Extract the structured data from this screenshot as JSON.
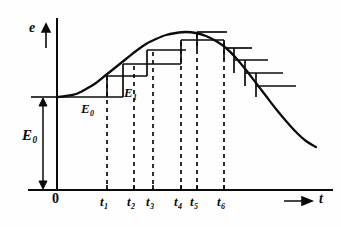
{
  "figure": {
    "background_color": "#fefefe",
    "ink_color": "#0b0b0b"
  },
  "axes": {
    "y_axis_label": "e",
    "x_axis_label": "t",
    "origin_label": "0",
    "y_axis_x_px": 57,
    "y_axis_top_px": 18,
    "x_axis_y_px": 190,
    "x_axis_left_px": 28,
    "x_axis_right_px": 333
  },
  "annotations": {
    "e0_bracket_label": "E",
    "e0_bracket_sub": "0",
    "e0_step_label": "E",
    "e0_step_sub": "0",
    "e1_step_label": "E",
    "e1_step_sub": "1"
  },
  "ticks": [
    {
      "label": "t",
      "sub": "1",
      "x_px": 107
    },
    {
      "label": "t",
      "sub": "2",
      "x_px": 134
    },
    {
      "label": "t",
      "sub": "3",
      "x_px": 153
    },
    {
      "label": "t",
      "sub": "4",
      "x_px": 181
    },
    {
      "label": "t",
      "sub": "5",
      "x_px": 197
    },
    {
      "label": "t",
      "sub": "6",
      "x_px": 224
    }
  ],
  "chart_data": {
    "type": "line",
    "xlabel": "t",
    "ylabel": "e",
    "grid": false,
    "legend": null,
    "xlim": [
      0,
      10
    ],
    "ylim": [
      0,
      10
    ],
    "baseline_level_px": 97,
    "peak_px": {
      "x": 186,
      "y": 32
    },
    "curve_points_px": [
      [
        57,
        97
      ],
      [
        66,
        96
      ],
      [
        76,
        94
      ],
      [
        86,
        89
      ],
      [
        96,
        83
      ],
      [
        106,
        75
      ],
      [
        116,
        67
      ],
      [
        126,
        59
      ],
      [
        136,
        51
      ],
      [
        146,
        44
      ],
      [
        156,
        39
      ],
      [
        166,
        35
      ],
      [
        176,
        33
      ],
      [
        186,
        32
      ],
      [
        196,
        33
      ],
      [
        206,
        36
      ],
      [
        216,
        41
      ],
      [
        226,
        48
      ],
      [
        236,
        58
      ],
      [
        246,
        70
      ],
      [
        256,
        83
      ],
      [
        266,
        96
      ],
      [
        276,
        109
      ],
      [
        286,
        121
      ],
      [
        296,
        132
      ],
      [
        306,
        141
      ],
      [
        316,
        147
      ]
    ],
    "ascending_steps_px": [
      {
        "x_start": 57,
        "x_end": 123,
        "y": 97
      },
      {
        "x_start": 107,
        "x_end": 147,
        "y": 76
      },
      {
        "x_start": 123,
        "x_end": 181,
        "y": 64
      },
      {
        "x_start": 147,
        "x_end": 186,
        "y": 50
      },
      {
        "x_start": 181,
        "x_end": 224,
        "y": 40
      },
      {
        "x_start": 197,
        "x_end": 227,
        "y": 32
      }
    ],
    "ascending_risers_px": [
      {
        "x": 107,
        "y_top": 76,
        "y_bottom": 97
      },
      {
        "x": 123,
        "y_top": 64,
        "y_bottom": 97
      },
      {
        "x": 147,
        "y_top": 50,
        "y_bottom": 76
      },
      {
        "x": 181,
        "y_top": 40,
        "y_bottom": 64
      },
      {
        "x": 197,
        "y_top": 32,
        "y_bottom": 50
      }
    ],
    "descending_steps_px": [
      {
        "x_start": 224,
        "x_end": 252,
        "y": 48
      },
      {
        "x_start": 234,
        "x_end": 268,
        "y": 60
      },
      {
        "x_start": 245,
        "x_end": 283,
        "y": 73
      },
      {
        "x_start": 256,
        "x_end": 296,
        "y": 86
      }
    ],
    "descending_risers_px": [
      {
        "x": 224,
        "y_top": 40,
        "y_bottom": 60
      },
      {
        "x": 234,
        "y_top": 48,
        "y_bottom": 73
      },
      {
        "x": 245,
        "y_top": 60,
        "y_bottom": 86
      },
      {
        "x": 256,
        "y_top": 73,
        "y_bottom": 97
      }
    ],
    "dashed_droplines_px": [
      {
        "x": 107,
        "y_top": 76,
        "y_bottom": 190
      },
      {
        "x": 134,
        "y_top": 66,
        "y_bottom": 190
      },
      {
        "x": 153,
        "y_top": 52,
        "y_bottom": 190
      },
      {
        "x": 181,
        "y_top": 42,
        "y_bottom": 190
      },
      {
        "x": 197,
        "y_top": 34,
        "y_bottom": 190
      },
      {
        "x": 224,
        "y_top": 42,
        "y_bottom": 190
      }
    ],
    "e0_bracket_px": {
      "x": 43,
      "y_top": 97,
      "y_bottom": 190
    }
  }
}
